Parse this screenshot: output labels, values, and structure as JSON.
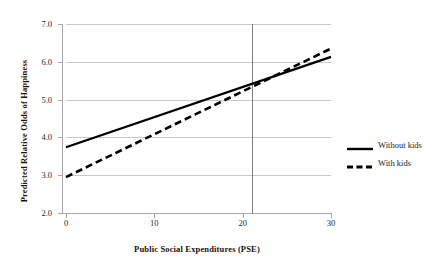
{
  "chart_data": {
    "type": "line",
    "title": "",
    "xlabel": "Public Social Expenditures (PSE)",
    "ylabel": "Predicted Relative Odds of Happiness",
    "xlim": [
      0,
      30
    ],
    "ylim": [
      2.0,
      7.0
    ],
    "x_ticks": [
      "0",
      "10",
      "20",
      "30"
    ],
    "x_tick_values": [
      0,
      10,
      20,
      30
    ],
    "y_ticks": [
      "2.0",
      "3.0",
      "4.0",
      "5.0",
      "6.0",
      "7.0"
    ],
    "y_tick_values": [
      2.0,
      3.0,
      4.0,
      5.0,
      6.0,
      7.0
    ],
    "grid": "horizontal",
    "legend_position": "right",
    "annotations": [
      {
        "name": "reference-line",
        "type": "vertical-line",
        "x": 21,
        "label": ""
      }
    ],
    "series": [
      {
        "name": "Without kids",
        "style": "solid",
        "color": "#000000",
        "x": [
          0,
          30
        ],
        "values": [
          3.74,
          6.13
        ]
      },
      {
        "name": "With kids",
        "style": "dashed",
        "color": "#000000",
        "x": [
          0,
          30
        ],
        "values": [
          2.95,
          6.35
        ]
      }
    ]
  },
  "legend": {
    "items": [
      {
        "label": "Without kids",
        "style": "solid"
      },
      {
        "label": "With kids",
        "style": "dashed"
      }
    ]
  }
}
